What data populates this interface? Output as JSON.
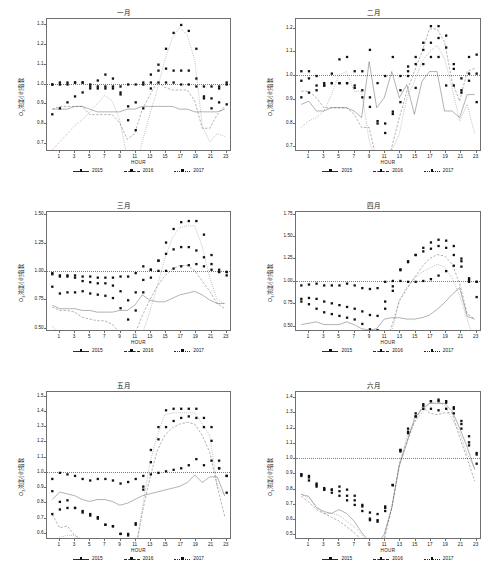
{
  "figure": {
    "axis_label_x": "HOUR",
    "axis_label_y_prefix": "O",
    "axis_label_y_sub": "3",
    "axis_label_y_suffix": "浓度小时指数",
    "legend": [
      "2015",
      "2016",
      "2017"
    ],
    "reference_value": "1.0"
  },
  "chart_data": [
    {
      "type": "line",
      "title": "一月",
      "xlabel": "HOUR",
      "ylabel": "O3浓度小时指数",
      "x": [
        0,
        1,
        2,
        3,
        4,
        5,
        6,
        7,
        8,
        9,
        10,
        11,
        12,
        13,
        14,
        15,
        16,
        17,
        18,
        19,
        20,
        21,
        22,
        23
      ],
      "xticks": [
        1,
        3,
        5,
        7,
        9,
        11,
        13,
        15,
        17,
        19,
        21,
        23
      ],
      "yticks": [
        0.7,
        0.8,
        0.9,
        1.0,
        1.1,
        1.2,
        1.3
      ],
      "ylim": [
        0.66,
        1.33
      ],
      "xlim": [
        -0.7,
        23.7
      ],
      "grid": false,
      "reference_line": 1.0,
      "legend_position": "bottom",
      "series": [
        {
          "name": "2015",
          "style": "solid",
          "values": [
            1.0,
            1.0,
            1.0,
            1.01,
            1.01,
            1.0,
            0.99,
            0.99,
            0.99,
            0.99,
            1.0,
            1.0,
            1.01,
            1.01,
            1.01,
            1.01,
            1.01,
            1.0,
            1.0,
            0.99,
            0.99,
            0.99,
            0.99,
            1.0
          ]
        },
        {
          "name": "2016",
          "style": "dashed",
          "values": [
            1.0,
            1.01,
            1.01,
            1.01,
            1.01,
            0.98,
            0.98,
            0.98,
            0.98,
            0.95,
            0.89,
            0.91,
            1.0,
            1.05,
            1.1,
            1.08,
            1.07,
            1.07,
            1.07,
            1.03,
            0.93,
            0.93,
            0.98,
            1.01
          ]
        },
        {
          "name": "2017",
          "style": "dotted",
          "values": [
            0.85,
            0.88,
            0.91,
            0.94,
            0.96,
            0.99,
            1.02,
            1.05,
            1.03,
            0.96,
            0.82,
            0.77,
            0.88,
            0.98,
            1.07,
            1.18,
            1.26,
            1.3,
            1.27,
            1.18,
            0.94,
            0.88,
            0.91,
            0.9
          ]
        }
      ]
    },
    {
      "type": "line",
      "title": "二月",
      "xlabel": "HOUR",
      "ylabel": "O3浓度小时指数",
      "x": [
        0,
        1,
        2,
        3,
        4,
        5,
        6,
        7,
        8,
        9,
        10,
        11,
        12,
        13,
        14,
        15,
        16,
        17,
        18,
        19,
        20,
        21,
        22,
        23
      ],
      "xticks": [
        1,
        3,
        5,
        7,
        9,
        11,
        13,
        15,
        17,
        19,
        21,
        23
      ],
      "yticks": [
        0.7,
        0.8,
        0.9,
        1.0,
        1.1,
        1.2
      ],
      "ylim": [
        0.68,
        1.24
      ],
      "xlim": [
        -0.7,
        23.7
      ],
      "grid": false,
      "reference_line": 1.0,
      "legend_position": "bottom",
      "series": [
        {
          "name": "2015",
          "style": "solid",
          "values": [
            0.98,
            0.99,
            0.96,
            0.96,
            0.97,
            0.97,
            0.97,
            0.96,
            0.94,
            1.11,
            0.97,
            1.0,
            1.08,
            1.0,
            1.04,
            0.95,
            1.05,
            1.08,
            1.08,
            0.96,
            0.96,
            0.94,
            1.01,
            1.01
          ]
        },
        {
          "name": "2016",
          "style": "dashed",
          "values": [
            1.02,
            1.02,
            1.0,
            0.97,
            0.97,
            0.97,
            0.97,
            0.95,
            0.91,
            0.91,
            0.81,
            0.76,
            0.85,
            0.94,
            1.02,
            1.08,
            1.14,
            1.21,
            1.21,
            1.17,
            1.05,
            0.99,
            1.08,
            1.09
          ]
        },
        {
          "name": "2017",
          "style": "dotted",
          "values": [
            0.91,
            0.93,
            0.94,
            0.96,
            1.01,
            1.07,
            1.08,
            1.02,
            1.02,
            0.87,
            0.8,
            0.8,
            0.84,
            0.89,
            1.0,
            1.05,
            1.11,
            1.14,
            1.16,
            1.12,
            1.03,
            0.93,
            0.98,
            0.89
          ]
        }
      ]
    },
    {
      "type": "line",
      "title": "三月",
      "xlabel": "HOUR",
      "ylabel": "O3浓度小时指数",
      "x": [
        0,
        1,
        2,
        3,
        4,
        5,
        6,
        7,
        8,
        9,
        10,
        11,
        12,
        13,
        14,
        15,
        16,
        17,
        18,
        19,
        20,
        21,
        22,
        23
      ],
      "xticks": [
        1,
        3,
        5,
        7,
        9,
        11,
        13,
        15,
        17,
        19,
        21,
        23
      ],
      "yticks": [
        0.5,
        0.75,
        1.0,
        1.25,
        1.5
      ],
      "ylim": [
        0.47,
        1.53
      ],
      "xlim": [
        -0.7,
        23.7
      ],
      "grid": false,
      "reference_line": 1.0,
      "legend_position": "bottom",
      "series": [
        {
          "name": "2015",
          "style": "solid",
          "values": [
            0.99,
            0.97,
            0.97,
            0.97,
            0.96,
            0.96,
            0.95,
            0.95,
            0.95,
            0.96,
            0.96,
            0.99,
            1.05,
            1.02,
            1.01,
            1.01,
            1.03,
            1.05,
            1.06,
            1.07,
            1.05,
            1.02,
            1.0,
            1.0
          ]
        },
        {
          "name": "2016",
          "style": "dashed",
          "values": [
            0.98,
            0.96,
            0.96,
            0.95,
            0.92,
            0.91,
            0.9,
            0.9,
            0.88,
            0.83,
            0.75,
            0.82,
            0.93,
            1.02,
            1.1,
            1.16,
            1.2,
            1.22,
            1.22,
            1.19,
            1.13,
            1.07,
            1.0,
            0.97
          ]
        },
        {
          "name": "2017",
          "style": "dotted",
          "values": [
            0.87,
            0.81,
            0.82,
            0.82,
            0.83,
            0.81,
            0.8,
            0.79,
            0.77,
            0.68,
            0.58,
            0.66,
            0.82,
            0.95,
            1.1,
            1.26,
            1.38,
            1.44,
            1.45,
            1.45,
            1.33,
            1.15,
            1.02,
            1.0
          ]
        }
      ]
    },
    {
      "type": "line",
      "title": "四月",
      "xlabel": "HOUR",
      "ylabel": "O3浓度小时指数",
      "x": [
        0,
        1,
        2,
        3,
        4,
        5,
        6,
        7,
        8,
        9,
        10,
        11,
        12,
        13,
        14,
        15,
        16,
        17,
        18,
        19,
        20,
        21,
        22,
        23
      ],
      "xticks": [
        1,
        3,
        5,
        7,
        9,
        11,
        13,
        15,
        17,
        19,
        21,
        23
      ],
      "yticks": [
        0.5,
        0.75,
        1.0,
        1.25,
        1.5,
        1.75
      ],
      "ylim": [
        0.44,
        1.78
      ],
      "xlim": [
        -0.7,
        23.7
      ],
      "grid": false,
      "reference_line": 1.0,
      "legend_position": "bottom",
      "series": [
        {
          "name": "2015",
          "style": "solid",
          "values": [
            0.96,
            0.97,
            0.98,
            0.96,
            0.96,
            0.96,
            0.98,
            0.96,
            0.93,
            0.92,
            0.93,
            1.0,
            1.01,
            1.01,
            1.0,
            1.0,
            1.01,
            1.03,
            1.07,
            1.12,
            1.18,
            1.23,
            1.02,
            1.0
          ]
        },
        {
          "name": "2016",
          "style": "dashed",
          "values": [
            0.81,
            0.82,
            0.81,
            0.78,
            0.76,
            0.74,
            0.72,
            0.7,
            0.67,
            0.63,
            0.62,
            0.78,
            0.95,
            1.13,
            1.22,
            1.3,
            1.38,
            1.44,
            1.47,
            1.46,
            1.4,
            1.26,
            1.04,
            1.0
          ]
        },
        {
          "name": "2017",
          "style": "dotted",
          "values": [
            0.78,
            0.75,
            0.7,
            0.66,
            0.64,
            0.62,
            0.6,
            0.58,
            0.53,
            0.47,
            0.46,
            0.7,
            0.9,
            1.14,
            1.23,
            1.3,
            1.34,
            1.37,
            1.4,
            1.38,
            1.3,
            1.17,
            1.0,
            0.83
          ]
        }
      ]
    },
    {
      "type": "line",
      "title": "五月",
      "xlabel": "HOUR",
      "ylabel": "O3浓度小时指数",
      "x": [
        0,
        1,
        2,
        3,
        4,
        5,
        6,
        7,
        8,
        9,
        10,
        11,
        12,
        13,
        14,
        15,
        16,
        17,
        18,
        19,
        20,
        21,
        22,
        23
      ],
      "xticks": [
        1,
        3,
        5,
        7,
        9,
        11,
        13,
        15,
        17,
        19,
        21,
        23
      ],
      "yticks": [
        0.6,
        0.7,
        0.8,
        0.9,
        1.0,
        1.1,
        1.2,
        1.3,
        1.4,
        1.5
      ],
      "ylim": [
        0.56,
        1.53
      ],
      "xlim": [
        -0.7,
        23.7
      ],
      "grid": false,
      "reference_line": 1.0,
      "legend_position": "bottom",
      "series": [
        {
          "name": "2015",
          "style": "solid",
          "values": [
            0.96,
            1.0,
            0.99,
            0.98,
            0.96,
            0.95,
            0.96,
            0.96,
            0.95,
            0.93,
            0.94,
            0.96,
            0.98,
            0.99,
            1.0,
            1.01,
            1.02,
            1.03,
            1.05,
            1.09,
            1.05,
            1.08,
            1.08,
            0.98
          ]
        },
        {
          "name": "2016",
          "style": "dashed",
          "values": [
            0.88,
            0.81,
            0.82,
            0.77,
            0.74,
            0.72,
            0.71,
            0.66,
            0.65,
            0.6,
            0.6,
            0.67,
            0.89,
            1.07,
            1.22,
            1.3,
            1.34,
            1.36,
            1.37,
            1.36,
            1.3,
            1.21,
            1.03,
            0.87
          ]
        },
        {
          "name": "2017",
          "style": "dotted",
          "values": [
            0.73,
            0.76,
            0.77,
            0.77,
            0.75,
            0.73,
            0.7,
            0.66,
            0.65,
            0.6,
            0.59,
            0.66,
            0.91,
            1.15,
            1.3,
            1.41,
            1.42,
            1.42,
            1.42,
            1.42,
            1.36,
            1.3,
            1.03,
            0.98
          ]
        }
      ]
    },
    {
      "type": "line",
      "title": "六月",
      "xlabel": "HOUR",
      "ylabel": "O3浓度小时指数",
      "x": [
        0,
        1,
        2,
        3,
        4,
        5,
        6,
        7,
        8,
        9,
        10,
        11,
        12,
        13,
        14,
        15,
        16,
        17,
        18,
        19,
        20,
        21,
        22,
        23
      ],
      "xticks": [
        1,
        3,
        5,
        7,
        9,
        11,
        13,
        15,
        17,
        19,
        21,
        23
      ],
      "yticks": [
        0.5,
        0.6,
        0.7,
        0.8,
        0.9,
        1.0,
        1.1,
        1.2,
        1.3,
        1.4
      ],
      "ylim": [
        0.47,
        1.44
      ],
      "xlim": [
        -0.7,
        23.7
      ],
      "grid": false,
      "reference_line": 1.0,
      "legend_position": "bottom",
      "series": [
        {
          "name": "2015",
          "style": "solid",
          "values": [
            0.9,
            0.89,
            0.83,
            0.81,
            0.8,
            0.82,
            0.8,
            0.76,
            0.7,
            0.65,
            0.64,
            0.69,
            0.83,
            1.05,
            1.17,
            1.3,
            1.35,
            1.38,
            1.38,
            1.38,
            1.34,
            1.25,
            1.15,
            1.03
          ]
        },
        {
          "name": "2016",
          "style": "dashed",
          "values": [
            0.89,
            0.86,
            0.82,
            0.8,
            0.78,
            0.76,
            0.73,
            0.7,
            0.66,
            0.6,
            0.6,
            0.66,
            0.83,
            1.06,
            1.18,
            1.28,
            1.36,
            1.33,
            1.32,
            1.33,
            1.33,
            1.2,
            1.09,
            0.97
          ]
        },
        {
          "name": "2017",
          "style": "dotted",
          "values": [
            0.9,
            0.88,
            0.84,
            0.8,
            0.8,
            0.79,
            0.76,
            0.73,
            0.69,
            0.61,
            0.59,
            0.68,
            0.83,
            1.06,
            1.2,
            1.28,
            1.33,
            1.38,
            1.39,
            1.37,
            1.3,
            1.23,
            1.11,
            1.04
          ]
        }
      ]
    }
  ]
}
